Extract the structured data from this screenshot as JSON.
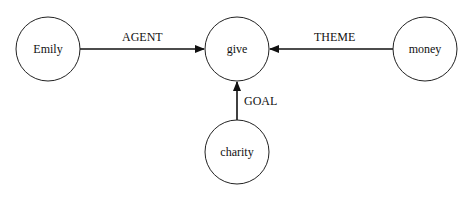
{
  "diagram": {
    "type": "semantic-role-graph",
    "nodes": [
      {
        "id": "emily",
        "label": "Emily",
        "cx": 48,
        "cy": 49,
        "r": 32
      },
      {
        "id": "give",
        "label": "give",
        "cx": 237,
        "cy": 49,
        "r": 32
      },
      {
        "id": "money",
        "label": "money",
        "cx": 425,
        "cy": 49,
        "r": 32
      },
      {
        "id": "charity",
        "label": "charity",
        "cx": 237,
        "cy": 152,
        "r": 32
      }
    ],
    "edges": [
      {
        "from": "emily",
        "to": "give",
        "label": "AGENT"
      },
      {
        "from": "money",
        "to": "give",
        "label": "THEME"
      },
      {
        "from": "charity",
        "to": "give",
        "label": "GOAL"
      }
    ]
  }
}
